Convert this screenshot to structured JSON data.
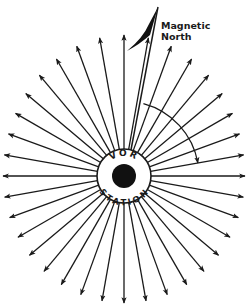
{
  "diagram": {
    "station_label_top": "VOR",
    "station_label_bottom": "STATION",
    "magnetic_north_label_line1": "Magnetic",
    "magnetic_north_label_line2": "North",
    "radial_count": 36,
    "radial_spacing_deg": 10,
    "magnetic_north_bearing_deg": 15,
    "arc_end_bearing_deg": 80,
    "colors": {
      "ink": "#1a1a1a",
      "background": "#ffffff"
    }
  }
}
